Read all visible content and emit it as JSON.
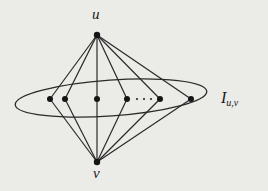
{
  "diagram": {
    "type": "graph",
    "labels": {
      "top_vertex": "u",
      "bottom_vertex": "v",
      "set_main": "I",
      "set_sub": "u,v"
    },
    "vertices": {
      "u": {
        "x": 97,
        "y": 35
      },
      "v": {
        "x": 97,
        "y": 162
      },
      "inner": [
        {
          "x": 50,
          "y": 99
        },
        {
          "x": 65,
          "y": 99
        },
        {
          "x": 97,
          "y": 99
        },
        {
          "x": 127,
          "y": 99
        },
        {
          "x": 160,
          "y": 99
        },
        {
          "x": 191,
          "y": 99
        }
      ]
    },
    "ellipsis_dots": [
      {
        "x": 137,
        "y": 99
      },
      {
        "x": 144,
        "y": 99
      },
      {
        "x": 151,
        "y": 99
      }
    ],
    "edges_description": "u and v are each adjacent to every vertex in the independent set I_{u,v}; u is also adjacent to v",
    "ellipse": {
      "cx": 111,
      "cy": 98,
      "rx": 96,
      "ry": 18,
      "rotate": -4
    },
    "colors": {
      "stroke": "#2a2a2a",
      "background": "#ebebe8"
    }
  }
}
